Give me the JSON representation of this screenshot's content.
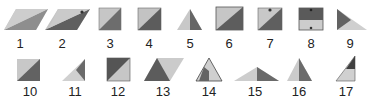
{
  "figure": {
    "colors": {
      "light": "#c9c9c9",
      "mid": "#9a9a9a",
      "dark": "#5f5f5f",
      "edge": "#3a3a3a"
    },
    "items": [
      {
        "id": 1,
        "label": "1",
        "shape": "parallelogram-split"
      },
      {
        "id": 2,
        "label": "2",
        "shape": "parallelogram-split-notch"
      },
      {
        "id": 3,
        "label": "3",
        "shape": "square-diagonal"
      },
      {
        "id": 4,
        "label": "4",
        "shape": "square-diagonal"
      },
      {
        "id": 5,
        "label": "5",
        "shape": "triangle-split"
      },
      {
        "id": 6,
        "label": "6",
        "shape": "square-diagonal"
      },
      {
        "id": 7,
        "label": "7",
        "shape": "square-diagonal-notch"
      },
      {
        "id": 8,
        "label": "8",
        "shape": "square-horizontal-split"
      },
      {
        "id": 9,
        "label": "9",
        "shape": "triangle-right-pointing"
      },
      {
        "id": 10,
        "label": "10",
        "shape": "square-diagonal"
      },
      {
        "id": 11,
        "label": "11",
        "shape": "triangle-inset"
      },
      {
        "id": 12,
        "label": "12",
        "shape": "square-diagonal-inverted"
      },
      {
        "id": 13,
        "label": "13",
        "shape": "triangle-with-parallelogram"
      },
      {
        "id": 14,
        "label": "14",
        "shape": "triangle-inner-square"
      },
      {
        "id": 15,
        "label": "15",
        "shape": "wide-triangle-split"
      },
      {
        "id": 16,
        "label": "16",
        "shape": "triangle-split"
      },
      {
        "id": 17,
        "label": "17",
        "shape": "right-triangle-horizontal-split"
      }
    ]
  }
}
